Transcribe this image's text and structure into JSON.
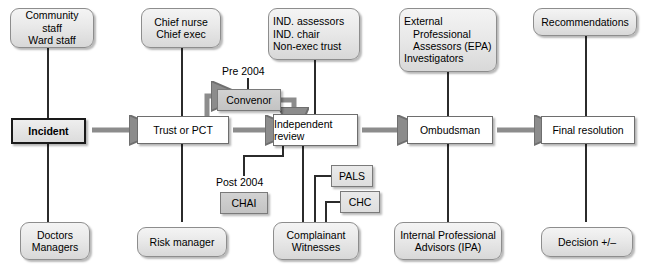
{
  "diagram": {
    "type": "flowchart",
    "colors": {
      "capsule_fill": "#e9e9e9",
      "process_fill": "#ffffff",
      "tag_dark_fill": "#c9c9c9",
      "tag_light_fill": "#e4e4e4",
      "border": "#6e6e6e",
      "start_border": "#1a1a1a",
      "arrow": "#8c8c8c",
      "line": "#2b2b2b"
    }
  },
  "spine": {
    "incident": "Incident",
    "trust": "Trust or PCT",
    "independent_review": "Independent\nreview",
    "independent_review_l1": "Independent",
    "independent_review_l2": "review",
    "ombudsman": "Ombudsman",
    "final_resolution": "Final resolution"
  },
  "top_actors": [
    {
      "id": "community",
      "l1": "Community staff",
      "l2": "Ward staff"
    },
    {
      "id": "chief",
      "l1": "Chief nurse",
      "l2": "Chief exec"
    },
    {
      "id": "ind",
      "l1": "IND. assessors",
      "l2": "IND. chair",
      "l3": "Non-exec trust"
    },
    {
      "id": "external",
      "l1": "External",
      "l2": "Professional",
      "l3": "Assessors (EPA)",
      "l4": "Investigators"
    },
    {
      "id": "recommendations",
      "l1": "Recommendations"
    }
  ],
  "bottom_actors": [
    {
      "id": "doctors",
      "l1": "Doctors",
      "l2": "Managers"
    },
    {
      "id": "risk",
      "l1": "Risk manager"
    },
    {
      "id": "complainant",
      "l1": "Complainant",
      "l2": "Witnesses"
    },
    {
      "id": "ipa",
      "l1": "Internal Professional",
      "l2": "Advisors (IPA)"
    },
    {
      "id": "decision",
      "l1": "Decision +/–"
    }
  ],
  "tags": {
    "pre_2004_caption": "Pre 2004",
    "convenor": "Convenor",
    "post_2004_caption": "Post 2004",
    "chai": "CHAI",
    "pals": "PALS",
    "chc": "CHC"
  }
}
